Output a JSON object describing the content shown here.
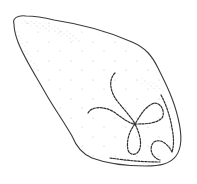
{
  "figure": {
    "kind": "scientific line illustration",
    "colors": {
      "background": "#ffffff",
      "outline": "#3a3a3a",
      "stipple": "#9a9a9a",
      "filament": "#2e2e2e"
    }
  }
}
